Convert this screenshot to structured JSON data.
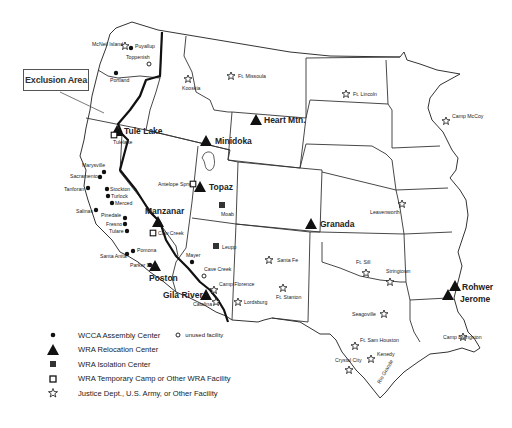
{
  "map": {
    "title_callout": "Exclusion Area",
    "legend": [
      {
        "symbol": "dot-icon",
        "label": "WCCA Assembly Center",
        "extra_symbol": "circle-icon",
        "extra_label": "unused facility"
      },
      {
        "symbol": "triangle-icon",
        "label": "WRA Relocation Center"
      },
      {
        "symbol": "filled-square-icon",
        "label": "WRA Isolation Center"
      },
      {
        "symbol": "open-square-icon",
        "label": "WRA Temporary Camp or Other WRA Facility"
      },
      {
        "symbol": "star-icon",
        "label": "Justice Dept., U.S. Army, or Other Facility"
      }
    ],
    "relocation_centers": [
      {
        "name": "Tule Lake",
        "x": 117,
        "y": 131
      },
      {
        "name": "Minidoka",
        "x": 206,
        "y": 141
      },
      {
        "name": "Heart Mtn.",
        "x": 256,
        "y": 120
      },
      {
        "name": "Topaz",
        "x": 199,
        "y": 187
      },
      {
        "name": "Manzanar",
        "x": 160,
        "y": 222
      },
      {
        "name": "Granada",
        "x": 311,
        "y": 223
      },
      {
        "name": "Poston",
        "x": 154,
        "y": 266
      },
      {
        "name": "Gila River",
        "x": 205,
        "y": 293
      },
      {
        "name": "Rohwer",
        "x": 454,
        "y": 286
      },
      {
        "name": "Jerome",
        "x": 448,
        "y": 295
      }
    ],
    "assembly_centers": [
      {
        "name": "Puyallup",
        "x": 131,
        "y": 47
      },
      {
        "name": "Portland",
        "x": 116,
        "y": 73
      },
      {
        "name": "Marysville",
        "x": 104,
        "y": 172
      },
      {
        "name": "Sacramento",
        "x": 100,
        "y": 177
      },
      {
        "name": "Tanforan",
        "x": 88,
        "y": 189
      },
      {
        "name": "Stockton",
        "x": 107,
        "y": 189
      },
      {
        "name": "Turlock",
        "x": 108,
        "y": 196
      },
      {
        "name": "Merced",
        "x": 112,
        "y": 203
      },
      {
        "name": "Salinas",
        "x": 96,
        "y": 210
      },
      {
        "name": "Pinedale",
        "x": 125,
        "y": 218
      },
      {
        "name": "Fresno",
        "x": 125,
        "y": 224
      },
      {
        "name": "Tulare",
        "x": 127,
        "y": 231
      },
      {
        "name": "Pomona",
        "x": 131,
        "y": 251
      },
      {
        "name": "Santa Anita",
        "x": 126,
        "y": 253
      },
      {
        "name": "Mayer",
        "x": 192,
        "y": 261
      }
    ],
    "unused_facilities": [
      {
        "name": "Toppenish",
        "x": 140,
        "y": 64
      },
      {
        "name": "Cave Creek",
        "x": 203,
        "y": 276
      }
    ],
    "isolation_centers": [
      {
        "name": "Moab",
        "x": 222,
        "y": 205
      },
      {
        "name": "Leupp",
        "x": 216,
        "y": 246
      }
    ],
    "temporary_camps": [
      {
        "name": "Tulelake",
        "x": 114,
        "y": 135
      },
      {
        "name": "Antelope Sprs.",
        "x": 193,
        "y": 183
      },
      {
        "name": "Cow Creek",
        "x": 153,
        "y": 232
      },
      {
        "name": "Parker Dam",
        "x": 151,
        "y": 265
      }
    ],
    "justice_army_facilities": [
      {
        "name": "McNeil Island",
        "x": 125,
        "y": 46
      },
      {
        "name": "Kooskia",
        "x": 188,
        "y": 80
      },
      {
        "name": "Ft. Missoula",
        "x": 231,
        "y": 76
      },
      {
        "name": "Ft. Lincoln",
        "x": 346,
        "y": 94
      },
      {
        "name": "Camp McCoy",
        "x": 446,
        "y": 121
      },
      {
        "name": "Leavenworth",
        "x": 402,
        "y": 203
      },
      {
        "name": "Santa Fe",
        "x": 269,
        "y": 260
      },
      {
        "name": "Ft. Stanton",
        "x": 283,
        "y": 289
      },
      {
        "name": "Camp Florence",
        "x": 215,
        "y": 289
      },
      {
        "name": "Catalina",
        "x": 215,
        "y": 302
      },
      {
        "name": "Lordsburg",
        "x": 238,
        "y": 302
      },
      {
        "name": "Ft. Sill",
        "x": 365,
        "y": 272
      },
      {
        "name": "Stringtown",
        "x": 390,
        "y": 282
      },
      {
        "name": "Seagoville",
        "x": 383,
        "y": 314
      },
      {
        "name": "Camp Livingston",
        "x": 463,
        "y": 337
      },
      {
        "name": "Ft. Sam Houston",
        "x": 355,
        "y": 345
      },
      {
        "name": "Kenedy",
        "x": 371,
        "y": 359
      },
      {
        "name": "Crystal City",
        "x": 349,
        "y": 369
      }
    ],
    "river_labels": [
      "Rio Grande"
    ]
  }
}
